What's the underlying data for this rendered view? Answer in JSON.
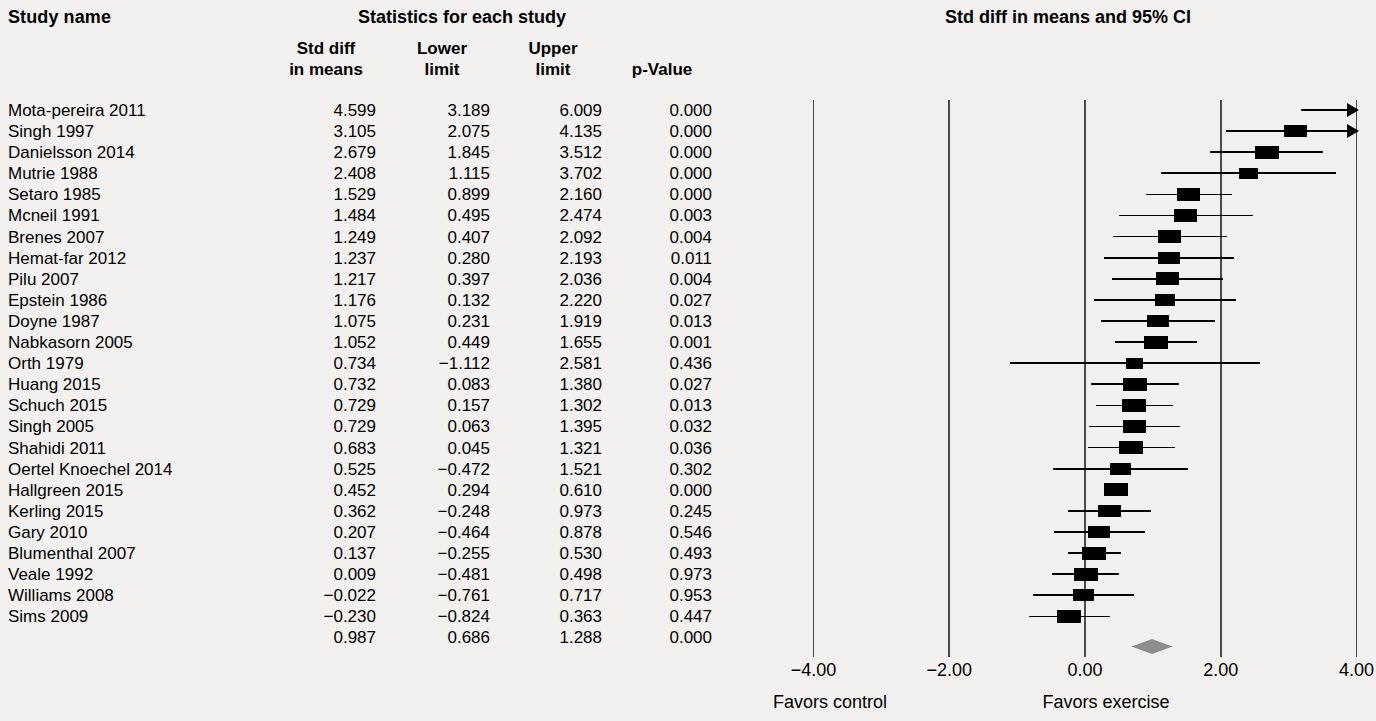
{
  "table": {
    "headers": {
      "study_name": "Study name",
      "group": "Statistics for each study",
      "std_diff_line1": "Std diff",
      "std_diff_line2": "in means",
      "lower_line1": "Lower",
      "lower_line2": "limit",
      "upper_line1": "Upper",
      "upper_line2": "limit",
      "p_value": "p-Value"
    },
    "rows": [
      {
        "name": "Mota-pereira 2011",
        "std_diff": "4.599",
        "lower": "3.189",
        "upper": "6.009",
        "p": "0.000"
      },
      {
        "name": "Singh 1997",
        "std_diff": "3.105",
        "lower": "2.075",
        "upper": "4.135",
        "p": "0.000"
      },
      {
        "name": "Danielsson 2014",
        "std_diff": "2.679",
        "lower": "1.845",
        "upper": "3.512",
        "p": "0.000"
      },
      {
        "name": "Mutrie 1988",
        "std_diff": "2.408",
        "lower": "1.115",
        "upper": "3.702",
        "p": "0.000"
      },
      {
        "name": "Setaro 1985",
        "std_diff": "1.529",
        "lower": "0.899",
        "upper": "2.160",
        "p": "0.000"
      },
      {
        "name": "Mcneil 1991",
        "std_diff": "1.484",
        "lower": "0.495",
        "upper": "2.474",
        "p": "0.003"
      },
      {
        "name": "Brenes 2007",
        "std_diff": "1.249",
        "lower": "0.407",
        "upper": "2.092",
        "p": "0.004"
      },
      {
        "name": "Hemat-far 2012",
        "std_diff": "1.237",
        "lower": "0.280",
        "upper": "2.193",
        "p": "0.011"
      },
      {
        "name": "Pilu 2007",
        "std_diff": "1.217",
        "lower": "0.397",
        "upper": "2.036",
        "p": "0.004"
      },
      {
        "name": "Epstein 1986",
        "std_diff": "1.176",
        "lower": "0.132",
        "upper": "2.220",
        "p": "0.027"
      },
      {
        "name": "Doyne 1987",
        "std_diff": "1.075",
        "lower": "0.231",
        "upper": "1.919",
        "p": "0.013"
      },
      {
        "name": "Nabkasorn 2005",
        "std_diff": "1.052",
        "lower": "0.449",
        "upper": "1.655",
        "p": "0.001"
      },
      {
        "name": "Orth 1979",
        "std_diff": "0.734",
        "lower": "−1.112",
        "upper": "2.581",
        "p": "0.436"
      },
      {
        "name": "Huang 2015",
        "std_diff": "0.732",
        "lower": "0.083",
        "upper": "1.380",
        "p": "0.027"
      },
      {
        "name": "Schuch 2015",
        "std_diff": "0.729",
        "lower": "0.157",
        "upper": "1.302",
        "p": "0.013"
      },
      {
        "name": "Singh 2005",
        "std_diff": "0.729",
        "lower": "0.063",
        "upper": "1.395",
        "p": "0.032"
      },
      {
        "name": "Shahidi 2011",
        "std_diff": "0.683",
        "lower": "0.045",
        "upper": "1.321",
        "p": "0.036"
      },
      {
        "name": "Oertel Knoechel 2014",
        "std_diff": "0.525",
        "lower": "−0.472",
        "upper": "1.521",
        "p": "0.302"
      },
      {
        "name": "Hallgreen 2015",
        "std_diff": "0.452",
        "lower": "0.294",
        "upper": "0.610",
        "p": "0.000"
      },
      {
        "name": "Kerling 2015",
        "std_diff": "0.362",
        "lower": "−0.248",
        "upper": "0.973",
        "p": "0.245"
      },
      {
        "name": "Gary 2010",
        "std_diff": "0.207",
        "lower": "−0.464",
        "upper": "0.878",
        "p": "0.546"
      },
      {
        "name": "Blumenthal 2007",
        "std_diff": "0.137",
        "lower": "−0.255",
        "upper": "0.530",
        "p": "0.493"
      },
      {
        "name": "Veale 1992",
        "std_diff": "0.009",
        "lower": "−0.481",
        "upper": "0.498",
        "p": "0.973"
      },
      {
        "name": "Williams 2008",
        "std_diff": "−0.022",
        "lower": "−0.761",
        "upper": "0.717",
        "p": "0.953"
      },
      {
        "name": "Sims 2009",
        "std_diff": "−0.230",
        "lower": "−0.824",
        "upper": "0.363",
        "p": "0.447"
      },
      {
        "name": "",
        "std_diff": "0.987",
        "lower": "0.686",
        "upper": "1.288",
        "p": "0.000"
      }
    ]
  },
  "plot": {
    "title": "Std diff in means and 95% CI",
    "axis_ticks": [
      "−4.00",
      "−2.00",
      "0.00",
      "2.00",
      "4.00"
    ],
    "axis_tick_values": [
      -4,
      -2,
      0,
      2,
      4
    ],
    "favors_left": "Favors control",
    "favors_right": "Favors exercise",
    "colors": {
      "marker": "#000000",
      "summary": "#8d8d8d",
      "axis": "#4a4a4a"
    }
  },
  "chart_data": {
    "type": "forest",
    "title": "Std diff in means and 95% CI",
    "xlabel": "Std diff in means",
    "xlim": [
      -4,
      4
    ],
    "grid": true,
    "effect_measure": "Std diff in means",
    "categories": [
      "Mota-pereira 2011",
      "Singh 1997",
      "Danielsson 2014",
      "Mutrie 1988",
      "Setaro 1985",
      "Mcneil 1991",
      "Brenes 2007",
      "Hemat-far 2012",
      "Pilu 2007",
      "Epstein 1986",
      "Doyne 1987",
      "Nabkasorn 2005",
      "Orth 1979",
      "Huang 2015",
      "Schuch 2015",
      "Singh 2005",
      "Shahidi 2011",
      "Oertel Knoechel 2014",
      "Hallgreen 2015",
      "Kerling 2015",
      "Gary 2010",
      "Blumenthal 2007",
      "Veale 1992",
      "Williams 2008",
      "Sims 2009"
    ],
    "effects": [
      4.599,
      3.105,
      2.679,
      2.408,
      1.529,
      1.484,
      1.249,
      1.237,
      1.217,
      1.176,
      1.075,
      1.052,
      0.734,
      0.732,
      0.729,
      0.729,
      0.683,
      0.525,
      0.452,
      0.362,
      0.207,
      0.137,
      0.009,
      -0.022,
      -0.23
    ],
    "lower": [
      3.189,
      2.075,
      1.845,
      1.115,
      0.899,
      0.495,
      0.407,
      0.28,
      0.397,
      0.132,
      0.231,
      0.449,
      -1.112,
      0.083,
      0.157,
      0.063,
      0.045,
      -0.472,
      0.294,
      -0.248,
      -0.464,
      -0.255,
      -0.481,
      -0.761,
      -0.824
    ],
    "upper": [
      6.009,
      4.135,
      3.512,
      3.702,
      2.16,
      2.474,
      2.092,
      2.193,
      2.036,
      2.22,
      1.919,
      1.655,
      2.581,
      1.38,
      1.302,
      1.395,
      1.321,
      1.521,
      0.61,
      0.973,
      0.878,
      0.53,
      0.498,
      0.717,
      0.363
    ],
    "p_values": [
      0.0,
      0.0,
      0.0,
      0.0,
      0.0,
      0.003,
      0.004,
      0.011,
      0.004,
      0.027,
      0.013,
      0.001,
      0.436,
      0.027,
      0.013,
      0.032,
      0.036,
      0.302,
      0.0,
      0.245,
      0.546,
      0.493,
      0.973,
      0.953,
      0.447
    ],
    "box_weights": [
      0.55,
      0.95,
      1.0,
      0.6,
      0.95,
      0.95,
      0.95,
      0.8,
      0.95,
      0.75,
      0.9,
      1.0,
      0.5,
      1.0,
      1.0,
      0.95,
      1.0,
      0.75,
      1.0,
      0.95,
      0.85,
      1.0,
      1.0,
      0.85,
      1.0
    ],
    "summary": {
      "label": "",
      "effect": 0.987,
      "lower": 0.686,
      "upper": 1.288,
      "p": 0.0
    },
    "xticks": [
      -4,
      -2,
      0,
      2,
      4
    ],
    "xticklabels": [
      "−4.00",
      "−2.00",
      "0.00",
      "2.00",
      "4.00"
    ],
    "annotations": [
      "Favors control",
      "Favors exercise"
    ]
  }
}
